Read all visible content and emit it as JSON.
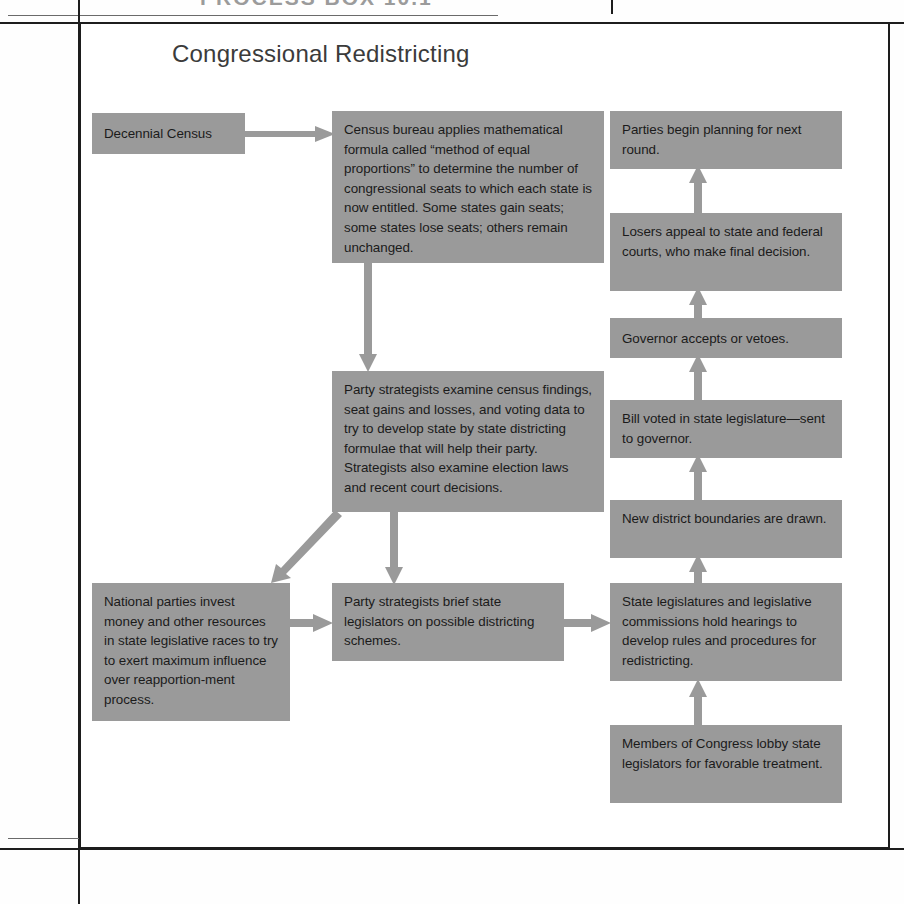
{
  "page": {
    "header_partial": "PROCESS BOX 10.1",
    "figure_title": "Congressional Redistricting"
  },
  "diagram": {
    "type": "flowchart",
    "box_fill": "#9a9a9a",
    "text_color": "#1b1b1b",
    "arrow_color": "#9a9a9a",
    "frame_color": "#1d1d1d",
    "nodes": [
      {
        "id": "decennial-census",
        "text": "Decennial Census",
        "column": "left",
        "x": 92,
        "y": 113,
        "w": 153,
        "h": 41
      },
      {
        "id": "census-bureau-formula",
        "text": "Census bureau applies mathematical formula called “method of equal proportions” to determine the number of congressional seats to which each state is now entitled. Some states gain seats; some states lose seats; others remain unchanged.",
        "column": "middle",
        "x": 332,
        "y": 111,
        "w": 272,
        "h": 152
      },
      {
        "id": "party-strategists-examine",
        "text": "Party strategists examine census findings, seat gains and losses, and voting data to try to develop state by state districting formulae that will help their party. Strategists also examine election laws and recent court decisions.",
        "column": "middle",
        "x": 332,
        "y": 371,
        "w": 272,
        "h": 141
      },
      {
        "id": "national-parties-invest",
        "text": "National parties invest money and other resources in state legislative races to try to exert maximum influence over reapportion-ment process.",
        "column": "left",
        "x": 92,
        "y": 583,
        "w": 198,
        "h": 138
      },
      {
        "id": "party-strategists-brief",
        "text": "Party  strategists brief state legislators on possible districting schemes.",
        "column": "middle",
        "x": 332,
        "y": 583,
        "w": 232,
        "h": 78
      },
      {
        "id": "parties-begin-planning",
        "text": "Parties begin planning for next round.",
        "column": "right",
        "x": 610,
        "y": 111,
        "w": 232,
        "h": 58
      },
      {
        "id": "losers-appeal",
        "text": "Losers appeal to state and federal courts, who make final decision.",
        "column": "right",
        "x": 610,
        "y": 213,
        "w": 232,
        "h": 78
      },
      {
        "id": "governor-accepts",
        "text": "Governor accepts or vetoes.",
        "column": "right",
        "x": 610,
        "y": 318,
        "w": 232,
        "h": 40
      },
      {
        "id": "bill-voted",
        "text": "Bill voted in state legislature—sent to governor.",
        "column": "right",
        "x": 610,
        "y": 400,
        "w": 232,
        "h": 58
      },
      {
        "id": "new-district-boundaries",
        "text": "New district boundaries are drawn.",
        "column": "right",
        "x": 610,
        "y": 500,
        "w": 232,
        "h": 58
      },
      {
        "id": "state-legislatures-hearings",
        "text": "State legislatures and legislative commissions hold hearings to develop rules and procedures for redistricting.",
        "column": "right",
        "x": 610,
        "y": 583,
        "w": 232,
        "h": 98
      },
      {
        "id": "members-of-congress-lobby",
        "text": "Members of Congress lobby state legislators for favorable treatment.",
        "column": "right",
        "x": 610,
        "y": 725,
        "w": 232,
        "h": 78
      }
    ],
    "edges": [
      {
        "id": "census-to-bureau",
        "from": "decennial-census",
        "to": "census-bureau-formula",
        "direction": "right"
      },
      {
        "id": "bureau-to-strategists",
        "from": "census-bureau-formula",
        "to": "party-strategists-examine",
        "direction": "down"
      },
      {
        "id": "strategists-to-national",
        "from": "party-strategists-examine",
        "to": "national-parties-invest",
        "direction": "diagonal-down-left"
      },
      {
        "id": "strategists-to-brief",
        "from": "party-strategists-examine",
        "to": "party-strategists-brief",
        "direction": "down"
      },
      {
        "id": "national-to-brief",
        "from": "national-parties-invest",
        "to": "party-strategists-brief",
        "direction": "right"
      },
      {
        "id": "brief-to-legislatures",
        "from": "party-strategists-brief",
        "to": "state-legislatures-hearings",
        "direction": "right"
      },
      {
        "id": "lobby-to-legislatures",
        "from": "members-of-congress-lobby",
        "to": "state-legislatures-hearings",
        "direction": "up"
      },
      {
        "id": "legislatures-to-boundaries",
        "from": "state-legislatures-hearings",
        "to": "new-district-boundaries",
        "direction": "up"
      },
      {
        "id": "boundaries-to-bill",
        "from": "new-district-boundaries",
        "to": "bill-voted",
        "direction": "up"
      },
      {
        "id": "bill-to-governor",
        "from": "bill-voted",
        "to": "governor-accepts",
        "direction": "up"
      },
      {
        "id": "governor-to-losers",
        "from": "governor-accepts",
        "to": "losers-appeal",
        "direction": "up"
      },
      {
        "id": "losers-to-parties",
        "from": "losers-appeal",
        "to": "parties-begin-planning",
        "direction": "up"
      }
    ]
  }
}
